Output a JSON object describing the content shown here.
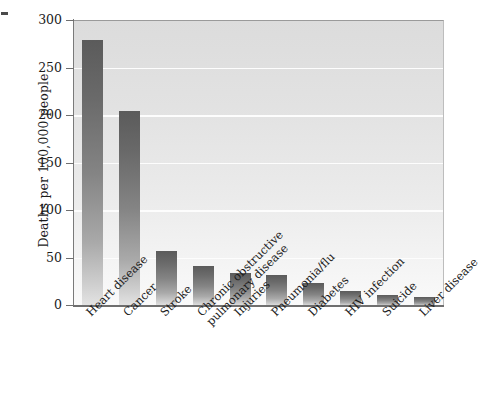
{
  "chart_data": {
    "type": "bar",
    "title": "",
    "subtitle": "",
    "xlabel": "",
    "ylabel": "Deaths per 100,000 people",
    "categories": [
      "Heart disease",
      "Cancer",
      "Stroke",
      "Chronic obstructive\npulmonary disease",
      "Injuries",
      "Pneumonia/flu",
      "Diabetes",
      "HIV infection",
      "Suicide",
      "Liver disease"
    ],
    "values": [
      280,
      205,
      58,
      42,
      35,
      33,
      24,
      16,
      12,
      9
    ],
    "ylim": [
      0,
      300
    ],
    "yticks": [
      0,
      50,
      100,
      150,
      200,
      250,
      300
    ],
    "ytick_labels": [
      "0",
      "50",
      "100",
      "150",
      "200",
      "250",
      "300"
    ],
    "grid": true,
    "grid_axis": "y",
    "legend": false,
    "legend_position": "none",
    "bar_color_top": "#5b5b5b",
    "bar_color_bottom": "#e4e4e4",
    "plot_background_top": "#dcdcdc",
    "plot_background_bottom": "#fafafa",
    "gridline_color": "#fdfdfd",
    "axis_color": "#6f6f6f",
    "text_color": "#1b1b1b"
  }
}
